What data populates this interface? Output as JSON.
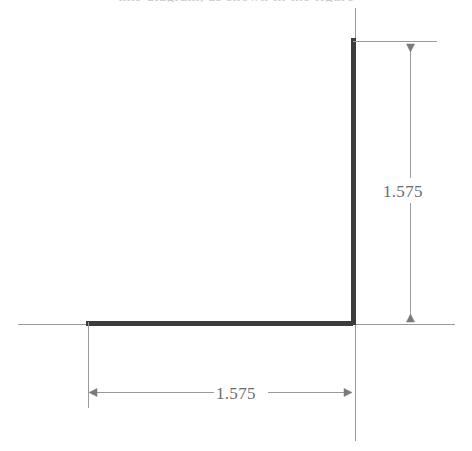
{
  "drawing": {
    "caption_clipped": "this diagram, as shown in the figure",
    "background_color": "#ffffff",
    "axis_color": "#9a9a9a",
    "object_color": "#3c3c3c",
    "dimension_color": "#8a8a8a",
    "text_color": "#6b6b6b",
    "axes": {
      "horizontal_label": "horizontal-axis-line",
      "vertical_label": "vertical-axis-line"
    },
    "shape": {
      "name": "L-shaped-profile",
      "vertical_leg_label": "vertical-leg",
      "horizontal_leg_label": "horizontal-leg"
    },
    "dimensions": [
      {
        "id": "vertical-dimension",
        "value": "1.575",
        "orientation": "vertical",
        "arrow_start": "down-arrow",
        "arrow_end": "up-arrow"
      },
      {
        "id": "horizontal-dimension",
        "value": "1.575",
        "orientation": "horizontal",
        "arrow_start": "left-arrow",
        "arrow_end": "right-arrow"
      }
    ]
  }
}
